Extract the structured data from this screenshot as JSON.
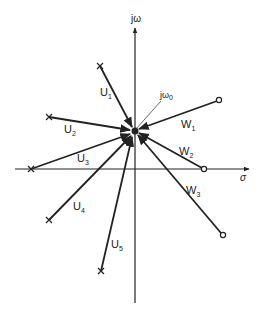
{
  "diagram": {
    "type": "s-plane vector diagram",
    "axes": {
      "vertical_label": "jω",
      "horizontal_label": "σ"
    },
    "point": {
      "label": "jω",
      "subscript": "0"
    },
    "zero_vectors": [
      {
        "label": "U",
        "subscript": "1",
        "marker": "x"
      },
      {
        "label": "U",
        "subscript": "2",
        "marker": "x"
      },
      {
        "label": "U",
        "subscript": "3",
        "marker": "x"
      },
      {
        "label": "U",
        "subscript": "4",
        "marker": "x"
      },
      {
        "label": "U",
        "subscript": "5",
        "marker": "x"
      }
    ],
    "pole_vectors": [
      {
        "label": "W",
        "subscript": "1",
        "marker": "o"
      },
      {
        "label": "W",
        "subscript": "2",
        "marker": "o"
      },
      {
        "label": "W",
        "subscript": "3",
        "marker": "o"
      }
    ],
    "colors": {
      "ink": "#222222",
      "background": "#ffffff"
    }
  }
}
